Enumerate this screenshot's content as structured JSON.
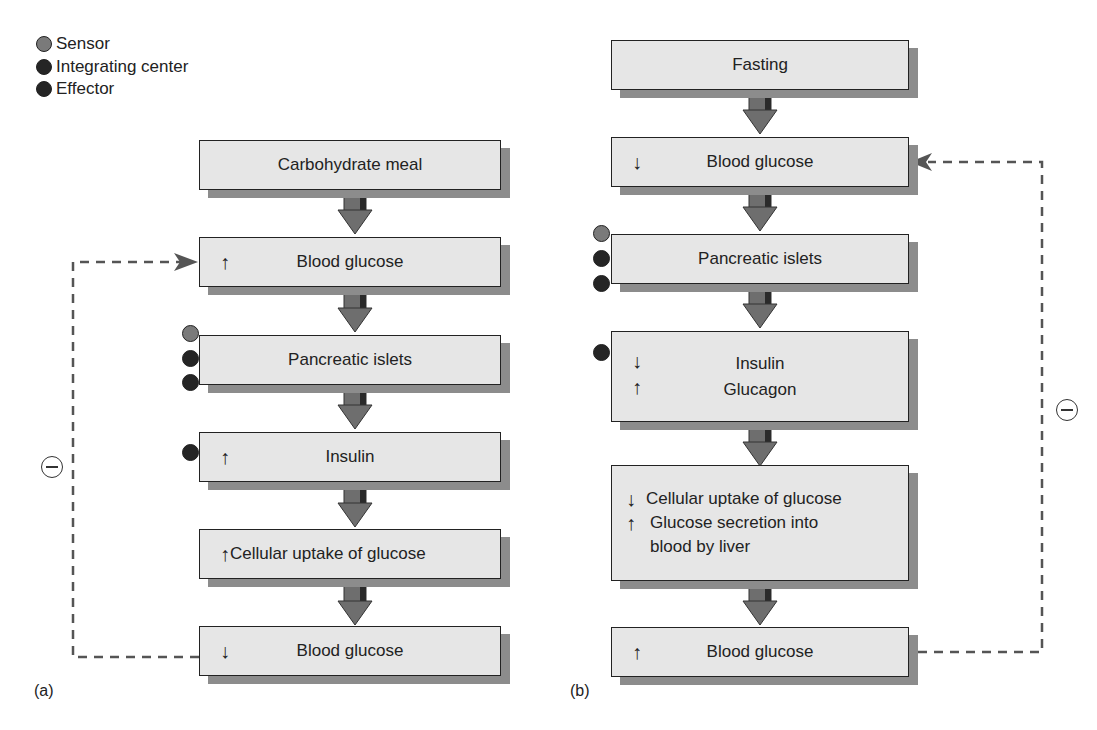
{
  "legend": [
    {
      "label": "Sensor",
      "color": "#7a7a7a"
    },
    {
      "label": "Integrating center",
      "color": "#252525"
    },
    {
      "label": "Effector",
      "color": "#252525"
    }
  ],
  "panel_a": {
    "label": "(a)",
    "boxes": [
      {
        "text": "Carbohydrate meal",
        "symbol": ""
      },
      {
        "text": "Blood glucose",
        "symbol": "↑"
      },
      {
        "text": "Pancreatic islets",
        "symbol": ""
      },
      {
        "text": "Insulin",
        "symbol": "↑"
      },
      {
        "text": "Cellular uptake of glucose",
        "symbol": "↑"
      },
      {
        "text": "Blood glucose",
        "symbol": "↓"
      }
    ],
    "feedback": "−"
  },
  "panel_b": {
    "label": "(b)",
    "boxes": [
      {
        "text": "Fasting",
        "symbol": ""
      },
      {
        "text": "Blood glucose",
        "symbol": "↓"
      },
      {
        "text": "Pancreatic islets",
        "symbol": ""
      },
      {
        "rows": [
          {
            "symbol": "↓",
            "text": "Insulin"
          },
          {
            "symbol": "↑",
            "text": "Glucagon"
          }
        ]
      },
      {
        "rows": [
          {
            "symbol": "↓",
            "text": "Cellular uptake of glucose"
          },
          {
            "symbol": "↑",
            "text": "Glucose secretion into"
          },
          {
            "symbol": "",
            "text": "blood by liver"
          }
        ]
      },
      {
        "text": "Blood glucose",
        "symbol": "↑"
      }
    ],
    "feedback": "−"
  },
  "colors": {
    "box_fill": "#e6e6e6",
    "shadow": "#8c8c8c",
    "arrow": "#6e6e6e",
    "sensor": "#7a7a7a",
    "integrator": "#252525",
    "effector": "#252525"
  }
}
